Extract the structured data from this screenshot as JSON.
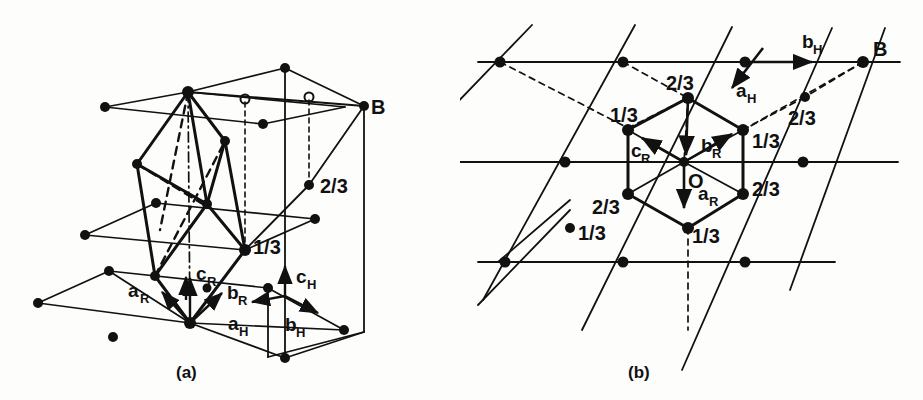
{
  "figure": {
    "background_color": "#fdfdfc",
    "ink_color": "#111111"
  },
  "panel_a": {
    "caption": "(a)",
    "point_B_label": "B",
    "height_labels": [
      {
        "text": "2/3",
        "x": 322,
        "y": 185
      },
      {
        "text": "1/3",
        "x": 259,
        "y": 250
      }
    ],
    "vectors": [
      {
        "name": "a_R",
        "base": "a",
        "sub": "R"
      },
      {
        "name": "b_R",
        "base": "b",
        "sub": "R"
      },
      {
        "name": "c_R",
        "base": "c",
        "sub": "R"
      },
      {
        "name": "a_H",
        "base": "a",
        "sub": "H"
      },
      {
        "name": "b_H",
        "base": "b",
        "sub": "H"
      },
      {
        "name": "c_H",
        "base": "c",
        "sub": "H"
      }
    ],
    "open_circle_count": 2,
    "description": "Perspective view of hexagonal prism outline with embedded rhombohedral cell; filled circles are lattice nodes, open circles mark projected positions."
  },
  "panel_b": {
    "caption": "(b)",
    "point_B_label": "B",
    "origin_label": "O",
    "height_labels": [
      {
        "text": "2/3",
        "x": 228,
        "y": 83,
        "note": "top hexagon vertex"
      },
      {
        "text": "1/3",
        "x": 150,
        "y": 117,
        "note": "upper-left hexagon vertex"
      },
      {
        "text": "1/3",
        "x": 310,
        "y": 146,
        "note": "upper-right hexagon vertex"
      },
      {
        "text": "2/3",
        "x": 318,
        "y": 192,
        "note": "lower-right hexagon vertex"
      },
      {
        "text": "2/3",
        "x": 140,
        "y": 207,
        "note": "lower-left hexagon vertex"
      },
      {
        "text": "1/3",
        "x": 243,
        "y": 237,
        "note": "bottom hexagon vertex"
      },
      {
        "text": "2/3",
        "x": 345,
        "y": 118,
        "note": "outside node upper right"
      },
      {
        "text": "1/3",
        "x": 124,
        "y": 237,
        "note": "isolated node lower left"
      }
    ],
    "vectors": [
      {
        "name": "a_R",
        "base": "a",
        "sub": "R"
      },
      {
        "name": "b_R",
        "base": "b",
        "sub": "R"
      },
      {
        "name": "c_R",
        "base": "c",
        "sub": "R"
      },
      {
        "name": "a_H",
        "base": "a",
        "sub": "H"
      },
      {
        "name": "b_H",
        "base": "b",
        "sub": "H"
      }
    ],
    "description": "Plan (projection down c) of the hexagonal net showing the rhombohedral cell projection as a hexagon about origin O."
  },
  "labels": {
    "a_base": "a",
    "b_base": "b",
    "c_base": "c",
    "sub_R": "R",
    "sub_H": "H",
    "B": "B",
    "O": "O",
    "one_third": "1/3",
    "two_thirds": "2/3",
    "caption_a": "(a)",
    "caption_b": "(b)"
  }
}
